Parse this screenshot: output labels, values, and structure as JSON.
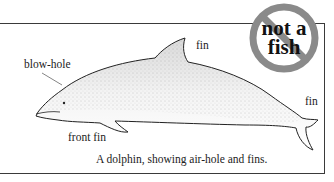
{
  "figure": {
    "subject": "dolphin",
    "labels": {
      "blow_hole": "blow-hole",
      "dorsal_fin": "fin",
      "tail_fin": "fin",
      "front_fin": "front fin"
    },
    "caption": "A dolphin, showing air-hole and fins."
  },
  "badge": {
    "line1": "not a",
    "line2": "fish",
    "ring_color": "#8a8a8a",
    "text_color": "#111111"
  }
}
